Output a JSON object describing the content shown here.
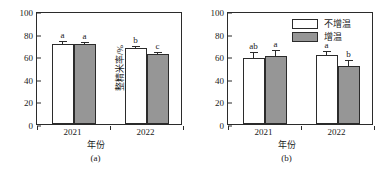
{
  "figure": {
    "background": "#ffffff",
    "bar_white_color": "#ffffff",
    "bar_gray_color": "#969696",
    "line_color": "#2b2b2b"
  },
  "legend": {
    "position": "top-right-of-panel-b",
    "entries": [
      {
        "label": "不增温",
        "swatch": "white"
      },
      {
        "label": "增温",
        "swatch": "gray"
      }
    ]
  },
  "chart_data": [
    {
      "type": "bar",
      "panel": "(a)",
      "title": "",
      "xlabel": "年份",
      "ylabel": "精米率/%",
      "ylim": [
        0,
        100
      ],
      "yticks": [
        0,
        20,
        40,
        60,
        80,
        100
      ],
      "grid": false,
      "legend_position": "none",
      "categories": [
        "2021",
        "2022"
      ],
      "series": [
        {
          "name": "不增温",
          "color": "#ffffff",
          "values": [
            71.0,
            67.0
          ],
          "errors": [
            1.2,
            1.3
          ],
          "sig_letters": [
            "a",
            "b"
          ]
        },
        {
          "name": "增温",
          "color": "#969696",
          "values": [
            71.2,
            62.0
          ],
          "errors": [
            0.8,
            1.0
          ],
          "sig_letters": [
            "a",
            "c"
          ]
        }
      ]
    },
    {
      "type": "bar",
      "panel": "(b)",
      "title": "",
      "xlabel": "年份",
      "ylabel": "整精米率/%",
      "ylim": [
        0,
        100
      ],
      "yticks": [
        0,
        20,
        40,
        60,
        80,
        100
      ],
      "grid": false,
      "legend_position": "upper-right",
      "categories": [
        "2021",
        "2022"
      ],
      "series": [
        {
          "name": "不增温",
          "color": "#ffffff",
          "values": [
            58.5,
            61.0
          ],
          "errors": [
            4.5,
            2.5
          ],
          "sig_letters": [
            "ab",
            "a"
          ]
        },
        {
          "name": "增温",
          "color": "#969696",
          "values": [
            60.0,
            51.5
          ],
          "errors": [
            5.0,
            4.0
          ],
          "sig_letters": [
            "a",
            "b"
          ]
        }
      ]
    }
  ]
}
